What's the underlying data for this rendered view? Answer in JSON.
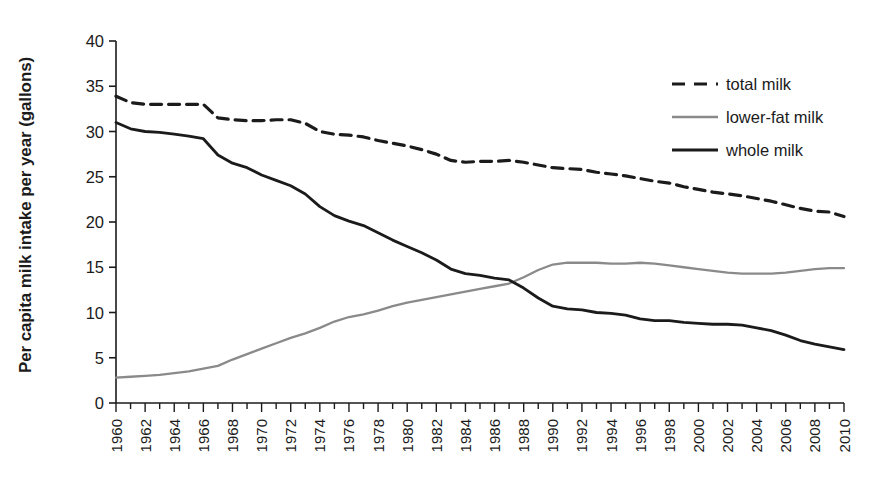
{
  "chart_data": {
    "type": "line",
    "title": "",
    "subtitle": "",
    "xlabel": "",
    "ylabel": "Per capita milk intake per year (gallons)",
    "xlim": [
      1960,
      2010
    ],
    "ylim": [
      0,
      40
    ],
    "yticks": [
      0,
      5,
      10,
      15,
      20,
      25,
      30,
      35,
      40
    ],
    "ytick_labels": [
      "0",
      "5",
      "10",
      "15",
      "20",
      "25",
      "30",
      "35",
      "40"
    ],
    "xticks": [
      1960,
      1962,
      1964,
      1966,
      1968,
      1970,
      1972,
      1974,
      1976,
      1978,
      1980,
      1982,
      1984,
      1986,
      1988,
      1990,
      1992,
      1994,
      1996,
      1998,
      2000,
      2002,
      2004,
      2006,
      2008,
      2010
    ],
    "xtick_labels": [
      "1960",
      "1962",
      "1964",
      "1966",
      "1968",
      "1970",
      "1972",
      "1974",
      "1976",
      "1978",
      "1980",
      "1982",
      "1984",
      "1986",
      "1988",
      "1990",
      "1992",
      "1994",
      "1996",
      "1998",
      "2000",
      "2002",
      "2004",
      "2006",
      "2008",
      "2010"
    ],
    "xtick_minor_every": 1,
    "grid": false,
    "legend_position": "top-right",
    "x": [
      1960,
      1961,
      1962,
      1963,
      1964,
      1965,
      1966,
      1967,
      1968,
      1969,
      1970,
      1971,
      1972,
      1973,
      1974,
      1975,
      1976,
      1977,
      1978,
      1979,
      1980,
      1981,
      1982,
      1983,
      1984,
      1985,
      1986,
      1987,
      1988,
      1989,
      1990,
      1991,
      1992,
      1993,
      1994,
      1995,
      1996,
      1997,
      1998,
      1999,
      2000,
      2001,
      2002,
      2003,
      2004,
      2005,
      2006,
      2007,
      2008,
      2009,
      2010
    ],
    "series": [
      {
        "name": "total milk",
        "style": "dashed",
        "color": "#1b1b1b",
        "values": [
          33.9,
          33.2,
          33.0,
          33.0,
          33.0,
          33.0,
          33.0,
          31.5,
          31.3,
          31.2,
          31.2,
          31.3,
          31.3,
          30.9,
          30.0,
          29.7,
          29.6,
          29.4,
          29.0,
          28.7,
          28.4,
          28.0,
          27.5,
          26.8,
          26.6,
          26.7,
          26.7,
          26.8,
          26.6,
          26.3,
          26.0,
          25.9,
          25.8,
          25.5,
          25.3,
          25.1,
          24.8,
          24.5,
          24.3,
          23.9,
          23.6,
          23.3,
          23.1,
          22.9,
          22.6,
          22.3,
          21.9,
          21.5,
          21.2,
          21.1,
          20.6
        ]
      },
      {
        "name": "lower-fat milk",
        "style": "solid",
        "color": "#8a8a8a",
        "values": [
          2.8,
          2.9,
          3.0,
          3.1,
          3.3,
          3.5,
          3.8,
          4.1,
          4.8,
          5.4,
          6.0,
          6.6,
          7.2,
          7.7,
          8.3,
          9.0,
          9.5,
          9.8,
          10.2,
          10.7,
          11.1,
          11.4,
          11.7,
          12.0,
          12.3,
          12.6,
          12.9,
          13.2,
          13.9,
          14.7,
          15.3,
          15.5,
          15.5,
          15.5,
          15.4,
          15.4,
          15.5,
          15.4,
          15.2,
          15.0,
          14.8,
          14.6,
          14.4,
          14.3,
          14.3,
          14.3,
          14.4,
          14.6,
          14.8,
          14.9,
          14.9
        ]
      },
      {
        "name": "whole milk",
        "style": "solid",
        "color": "#1b1b1b",
        "values": [
          31.0,
          30.3,
          30.0,
          29.9,
          29.7,
          29.5,
          29.2,
          27.4,
          26.5,
          26.0,
          25.2,
          24.6,
          24.0,
          23.1,
          21.7,
          20.7,
          20.1,
          19.6,
          18.8,
          18.0,
          17.3,
          16.6,
          15.8,
          14.8,
          14.3,
          14.1,
          13.8,
          13.6,
          12.7,
          11.6,
          10.7,
          10.4,
          10.3,
          10.0,
          9.9,
          9.7,
          9.3,
          9.1,
          9.1,
          8.9,
          8.8,
          8.7,
          8.7,
          8.6,
          8.3,
          8.0,
          7.5,
          6.9,
          6.5,
          6.2,
          5.9
        ]
      }
    ],
    "legend": [
      {
        "label": "total milk",
        "style": "dashed",
        "color": "#1b1b1b"
      },
      {
        "label": "lower-fat milk",
        "style": "solid",
        "color": "#8a8a8a"
      },
      {
        "label": "whole milk",
        "style": "solid",
        "color": "#1b1b1b"
      }
    ]
  }
}
